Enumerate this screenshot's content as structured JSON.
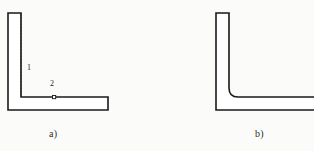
{
  "figure": {
    "background_color": "#fbfbf9",
    "stroke_color": "#1a1a1a",
    "fill_color": "#ffffff",
    "panels": [
      {
        "id": "panel-a",
        "caption": "a)",
        "description": "L-shaped angle profile cross-section with sharp square inner corner and a dashed construction line along the vertical leg inner face",
        "inner_corner": "sharp",
        "outline_points": "8,13 21,13 21,97 108,97 108,110 8,110",
        "dashed_line": {
          "x": 21,
          "y1": 14,
          "y2": 97
        },
        "markers": [
          {
            "id": "marker-2",
            "shape": "square",
            "x": 54,
            "y": 97,
            "size": 3
          }
        ],
        "annotations": [
          {
            "id": "label-1",
            "text": "1",
            "x": 27,
            "y": 63
          },
          {
            "id": "label-2",
            "text": "2",
            "x": 50,
            "y": 79
          }
        ]
      },
      {
        "id": "panel-b",
        "caption": "b)",
        "description": "L-shaped angle profile cross-section with a filleted (rounded) inner corner",
        "inner_corner": "filleted",
        "fillet_radius": 9,
        "outline_path": "M 216,13 L 229,13 L 229,88 Q 229,97 238,97 L 314,97 L 314,110 L 216,110 Z"
      }
    ]
  },
  "labels": {
    "caption_a": "a)",
    "caption_b": "b)",
    "number_1": "1",
    "number_2": "2"
  }
}
